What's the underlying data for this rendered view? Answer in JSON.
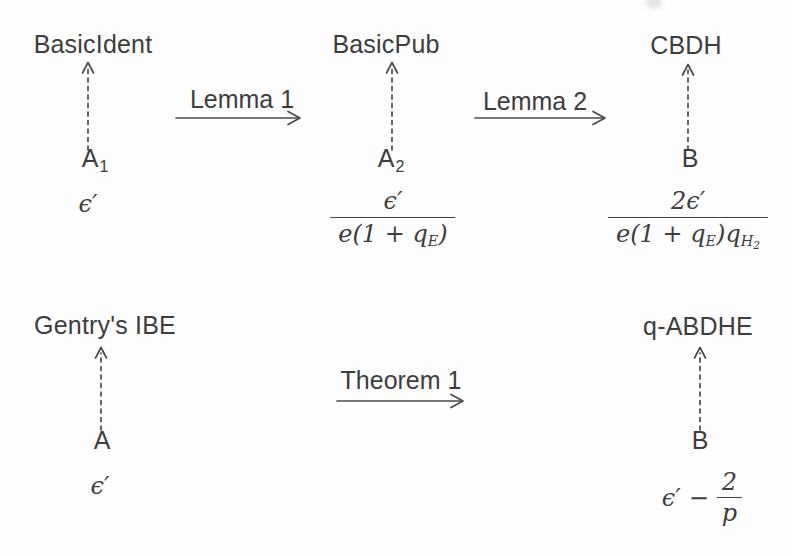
{
  "palette": {
    "ink": "#3d3d3d",
    "background": "#fdfdfd"
  },
  "diagram": {
    "top": {
      "schemes": {
        "left": "BasicIdent",
        "mid": "BasicPub",
        "right": "CBDH"
      },
      "adversaries": {
        "left": {
          "base": "A",
          "sub": "1"
        },
        "mid": {
          "base": "A",
          "sub": "2"
        },
        "right": {
          "base": "B"
        }
      },
      "reductions": {
        "left": "Lemma 1",
        "right": "Lemma 2"
      },
      "advantages": {
        "left": {
          "value": "ϵ′"
        },
        "mid": {
          "num": "ϵ′",
          "den_a": "e(1 + q",
          "den_a_sub": "E",
          "den_b": ")"
        },
        "right": {
          "num": "2ϵ′",
          "den_a": "e(1 + q",
          "den_a_sub": "E",
          "den_b": ")q",
          "den_b_sub": "H",
          "den_b_subsub": "2"
        }
      }
    },
    "bottom": {
      "schemes": {
        "left": "Gentry's IBE",
        "right": "q-ABDHE"
      },
      "adversaries": {
        "left": {
          "base": "A"
        },
        "right": {
          "base": "B"
        }
      },
      "reduction": "Theorem 1",
      "advantages": {
        "left": {
          "value": "ϵ′"
        },
        "right": {
          "lhs": "ϵ′",
          "op": "−",
          "num": "2",
          "den": "p"
        }
      }
    }
  }
}
